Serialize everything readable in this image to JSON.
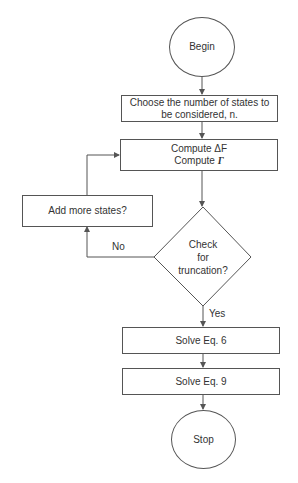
{
  "diagram": {
    "type": "flowchart",
    "nodes": {
      "begin": {
        "shape": "circle",
        "label": "Begin"
      },
      "choose": {
        "shape": "rect",
        "line1": "Choose the number of states to",
        "line2": "be considered, n."
      },
      "compute": {
        "shape": "rect",
        "line1": "Compute ΔF",
        "line2_prefix": "Compute ",
        "line2_symbol": "Γ"
      },
      "check": {
        "shape": "diamond",
        "line1": "Check",
        "line2": "for",
        "line3": "truncation?"
      },
      "add_states": {
        "shape": "rect",
        "label": "Add more states?"
      },
      "solve6": {
        "shape": "rect",
        "label": "Solve Eq. 6"
      },
      "solve9": {
        "shape": "rect",
        "label": "Solve Eq. 9"
      },
      "stop": {
        "shape": "circle",
        "label": "Stop"
      }
    },
    "edges": [
      {
        "from": "begin",
        "to": "choose",
        "label": ""
      },
      {
        "from": "choose",
        "to": "compute",
        "label": ""
      },
      {
        "from": "compute",
        "to": "check",
        "label": ""
      },
      {
        "from": "check",
        "to": "add_states",
        "label": "No"
      },
      {
        "from": "add_states",
        "to": "compute",
        "label": ""
      },
      {
        "from": "check",
        "to": "solve6",
        "label": "Yes"
      },
      {
        "from": "solve6",
        "to": "solve9",
        "label": ""
      },
      {
        "from": "solve9",
        "to": "stop",
        "label": ""
      }
    ],
    "edge_labels": {
      "no": "No",
      "yes": "Yes"
    },
    "colors": {
      "stroke": "#555555",
      "text": "#333333",
      "background": "#ffffff"
    }
  }
}
